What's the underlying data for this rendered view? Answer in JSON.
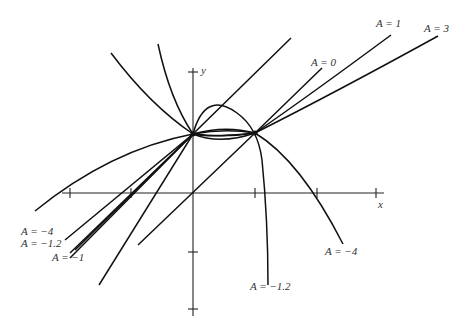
{
  "diagram": {
    "axes": {
      "x_label": "x",
      "y_label": "y"
    },
    "points": {
      "common_point_1": "left intersection on y-axis",
      "common_point_2": "right intersection"
    },
    "curve_labels": [
      {
        "id": "A1",
        "text": "A = 1"
      },
      {
        "id": "A3",
        "text": "A = 3"
      },
      {
        "id": "A0",
        "text": "A = 0"
      },
      {
        "id": "Am4_left",
        "text": "A = −4"
      },
      {
        "id": "Am1_2_left",
        "text": "A = −1.2"
      },
      {
        "id": "Am1_left",
        "text": "A = −1"
      },
      {
        "id": "Am4_right",
        "text": "A = −4"
      },
      {
        "id": "Am1_2_bottom",
        "text": "A = −1.2"
      }
    ]
  }
}
